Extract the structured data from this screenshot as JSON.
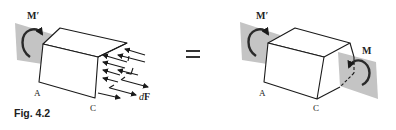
{
  "figure": {
    "caption": "Fig. 4.2",
    "equals_sign": "="
  },
  "left_diagram": {
    "label_moment": "M′",
    "label_a": "A",
    "label_c": "C",
    "label_force": "dF",
    "label_force_d": "d",
    "label_force_f": "F"
  },
  "right_diagram": {
    "label_moment_left": "M′",
    "label_moment_right": "M",
    "label_a": "A",
    "label_c": "C"
  },
  "colors": {
    "plane": "#c4c4c4",
    "line": "#1a1a1a",
    "background": "#ffffff"
  }
}
